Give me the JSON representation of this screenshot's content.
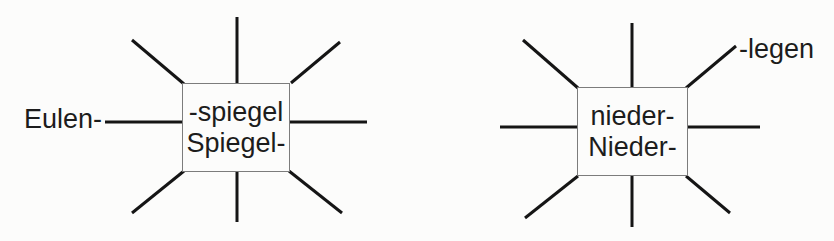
{
  "diagrams": [
    {
      "id": "spiegel-web",
      "center_line1": "-spiegel",
      "center_line2": "Spiegel-",
      "example_label": "Eulen-",
      "spoke_count": 8
    },
    {
      "id": "nieder-web",
      "center_line1": "nieder-",
      "center_line2": "Nieder-",
      "example_label": "-legen",
      "spoke_count": 8
    }
  ],
  "colors": {
    "background": "#fcfcfb",
    "line": "#151515",
    "box_border": "#7c7c7c",
    "text": "#1c1c1c"
  }
}
